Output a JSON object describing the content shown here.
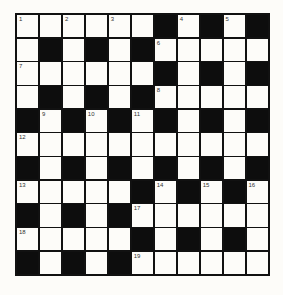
{
  "crossword": {
    "rows": 11,
    "cols": 11,
    "grid": [
      [
        "1",
        "",
        "2",
        "",
        "3",
        "",
        "#",
        "4",
        "#",
        "5",
        "#"
      ],
      [
        "",
        "#",
        "",
        "#",
        "",
        "#",
        "6",
        "",
        "",
        "",
        ""
      ],
      [
        "7",
        "",
        "",
        "",
        "",
        "",
        "#",
        "",
        "#",
        "",
        "#"
      ],
      [
        "",
        "#",
        "",
        "#",
        "",
        "#",
        "8",
        "",
        "",
        "",
        ""
      ],
      [
        "#",
        "9",
        "#",
        "10",
        "#",
        "11",
        "#",
        "",
        "#",
        "",
        "#"
      ],
      [
        "12",
        "",
        "",
        "",
        "",
        "",
        "",
        "",
        "",
        "",
        ""
      ],
      [
        "#",
        "",
        "#",
        "",
        "#",
        "",
        "#",
        "",
        "#",
        "",
        "#"
      ],
      [
        "13",
        "",
        "",
        "",
        "",
        "#",
        "14",
        "#",
        "15",
        "#",
        "16"
      ],
      [
        "#",
        "",
        "#",
        "",
        "#",
        "17",
        "",
        "",
        "",
        "",
        ""
      ],
      [
        "18",
        "",
        "",
        "",
        "",
        "#",
        "",
        "#",
        "",
        "#",
        ""
      ],
      [
        "#",
        "",
        "#",
        "",
        "#",
        "19",
        "",
        "",
        "",
        "",
        ""
      ]
    ],
    "legend": {
      "#": "black-square",
      "": "empty-white-square",
      "number": "clue-number-in-white-square"
    }
  },
  "colors": {
    "black_square": "#0d0d0d",
    "white_square": "#fdfcf9",
    "grid_line": "#111111",
    "number_text": "#333333"
  }
}
